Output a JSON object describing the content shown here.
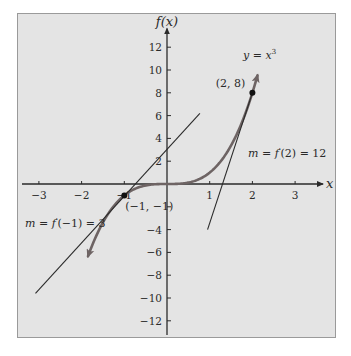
{
  "chart_data": {
    "type": "line",
    "title": "",
    "xlabel": "x",
    "ylabel": "f(x)",
    "xlim": [
      -3.5,
      3.7
    ],
    "ylim": [
      -13.3,
      14
    ],
    "x_ticks": [
      -3,
      -2,
      -1,
      1,
      2,
      3
    ],
    "x_tick_labels": [
      "−3",
      "−2",
      "−1",
      "1",
      "2",
      "3"
    ],
    "y_ticks": [
      12,
      10,
      8,
      6,
      4,
      2,
      -2,
      -4,
      -6,
      -8,
      -10,
      -12
    ],
    "y_tick_labels": [
      "12",
      "10",
      "8",
      "6",
      "4",
      "2",
      "",
      "−4",
      "−6",
      "−8",
      "−10",
      "−12"
    ],
    "grid": false,
    "series": [
      {
        "name": "y = x^3",
        "type": "curve",
        "function": "x^3",
        "x_range": [
          -1.85,
          2.12
        ],
        "color": "#6e6464",
        "arrows": "both"
      },
      {
        "name": "tangent at x = -1",
        "type": "segment",
        "points": [
          [
            -3.08,
            -9.6
          ],
          [
            0.77,
            6.2
          ]
        ],
        "color": "#2a2a2a"
      },
      {
        "name": "tangent at x = 2",
        "type": "segment",
        "points": [
          [
            0.95,
            -4.0
          ],
          [
            2.0,
            8.0
          ]
        ],
        "color": "#2a2a2a"
      }
    ],
    "points": [
      {
        "x": -1,
        "y": -1,
        "label": "(−1, −1)"
      },
      {
        "x": 2,
        "y": 8,
        "label": "(2, 8)"
      }
    ],
    "annotations": [
      {
        "text_parts": [
          "y",
          " = ",
          "x",
          "3"
        ],
        "label": "y = x³"
      },
      {
        "label": "m = f′(2) = 12",
        "text_parts": [
          "m",
          " = ",
          "f",
          "′",
          "(2) = 12"
        ]
      },
      {
        "label": "m = f′(−1) = 3",
        "text_parts": [
          "m",
          " = ",
          "f",
          "′",
          "(−1) = 3"
        ]
      }
    ]
  }
}
